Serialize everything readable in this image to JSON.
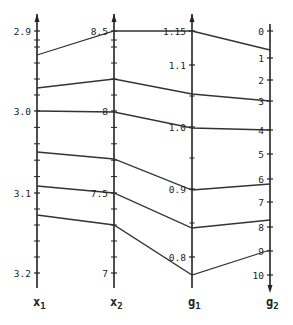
{
  "chart_data": {
    "type": "parallel_coordinates",
    "title": "",
    "axes": [
      {
        "name": "x1",
        "label": "x",
        "sub": "1",
        "ticks": [
          "2.9",
          "3.0",
          "3.1",
          "3.2"
        ],
        "range": [
          2.9,
          3.2
        ],
        "inverted": true
      },
      {
        "name": "x2",
        "label": "x",
        "sub": "2",
        "ticks": [
          "8.5",
          "8",
          "7.5",
          "7"
        ],
        "range": [
          8.5,
          7.0
        ],
        "inverted": false
      },
      {
        "name": "g1",
        "label": "g",
        "sub": "1",
        "ticks": [
          "1.15",
          "1.1",
          "1.0",
          "0.9",
          "0.8"
        ],
        "range": [
          1.15,
          0.77
        ],
        "inverted": false
      },
      {
        "name": "g2",
        "label": "g",
        "sub": "2",
        "ticks": [
          "0",
          "1",
          "2",
          "3",
          "4",
          "5",
          "6",
          "7",
          "8",
          "9",
          "10"
        ],
        "range": [
          0,
          10
        ],
        "inverted": true
      }
    ],
    "series": [
      {
        "name": "line-1",
        "values": {
          "x1": 2.93,
          "x2": 8.5,
          "g1": 1.15,
          "g2": 0.7
        }
      },
      {
        "name": "line-2",
        "values": {
          "x1": 2.97,
          "x2": 8.2,
          "g1": 1.05,
          "g2": 3.0
        }
      },
      {
        "name": "line-3",
        "values": {
          "x1": 3.0,
          "x2": 8.0,
          "g1": 1.0,
          "g2": 4.0
        }
      },
      {
        "name": "line-4",
        "values": {
          "x1": 3.05,
          "x2": 7.7,
          "g1": 0.9,
          "g2": 6.2
        }
      },
      {
        "name": "line-5",
        "values": {
          "x1": 3.09,
          "x2": 7.5,
          "g1": 0.84,
          "g2": 7.7
        }
      },
      {
        "name": "line-6",
        "values": {
          "x1": 3.125,
          "x2": 7.3,
          "g1": 0.77,
          "g2": 9.0
        }
      }
    ],
    "grid": false,
    "legend": "none"
  },
  "layout": {
    "axis_x": [
      37,
      114,
      192,
      270
    ],
    "tick_y": {
      "x1": [
        31,
        111,
        193,
        273
      ],
      "x2": [
        31,
        111,
        193,
        273
      ],
      "g1": [
        31,
        65,
        127,
        189,
        257
      ],
      "g2": [
        31,
        58,
        80,
        101,
        130,
        154,
        179,
        202,
        227,
        251,
        275
      ]
    },
    "line_y": [
      [
        55,
        31,
        31,
        50
      ],
      [
        88,
        79,
        94,
        101
      ],
      [
        111,
        112,
        128,
        130
      ],
      [
        152,
        159,
        190,
        184
      ],
      [
        186,
        193,
        228,
        220
      ],
      [
        215,
        225,
        275,
        250
      ]
    ],
    "line_color": "#333333",
    "axis_color": "#222222"
  }
}
